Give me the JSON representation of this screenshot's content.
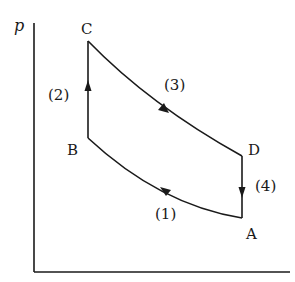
{
  "diagram": {
    "type": "pV cycle",
    "axis": {
      "y_label": "p",
      "x_label": ""
    },
    "points": [
      {
        "name": "A",
        "label": "A"
      },
      {
        "name": "B",
        "label": "B"
      },
      {
        "name": "C",
        "label": "C"
      },
      {
        "name": "D",
        "label": "D"
      }
    ],
    "processes": [
      {
        "id": "1",
        "label": "(1)",
        "from": "A",
        "to": "B",
        "shape": "curve"
      },
      {
        "id": "2",
        "label": "(2)",
        "from": "B",
        "to": "C",
        "shape": "vertical"
      },
      {
        "id": "3",
        "label": "(3)",
        "from": "C",
        "to": "D",
        "shape": "curve"
      },
      {
        "id": "4",
        "label": "(4)",
        "from": "D",
        "to": "A",
        "shape": "vertical"
      }
    ],
    "colors": {
      "line": "#1a1a1a",
      "background": "#ffffff"
    }
  }
}
